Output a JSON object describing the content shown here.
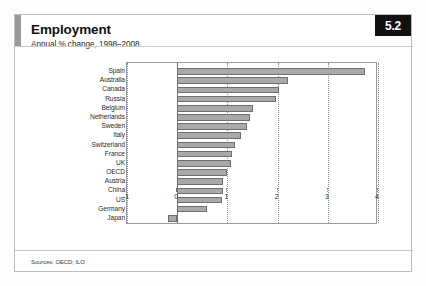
{
  "card": {
    "badge": "5.2",
    "title": "Employment",
    "subtitle": "Annual % change, 1998–2008",
    "source_note": "Sources: OECD; ILO"
  },
  "style": {
    "bar_fill": "#a9a9a9",
    "bar_stroke": "#6f6f6f",
    "badge_bg": "#111111",
    "badge_fg": "#ffffff",
    "accent": "#9a9a9a",
    "grid": "#8d8d8d",
    "frame": "#bdbdbd"
  },
  "chart_data": {
    "type": "bar",
    "orientation": "horizontal",
    "title": "Employment",
    "subtitle": "Annual % change, 1998–2008",
    "xlabel": "",
    "ylabel": "",
    "xlim": [
      -1,
      4
    ],
    "xticks": [
      -1,
      0,
      1,
      2,
      3,
      4
    ],
    "xtick_labels": [
      "-1",
      "0",
      "1",
      "2",
      "3",
      "4"
    ],
    "grid": true,
    "grid_axis": "x",
    "legend": false,
    "categories": [
      "Spain",
      "Australia",
      "Canada",
      "Russia",
      "Belgium",
      "Netherlands",
      "Sweden",
      "Italy",
      "Switzerland",
      "France",
      "UK",
      "OECD",
      "Austria",
      "China",
      "US",
      "Germany",
      "Japan"
    ],
    "values": [
      3.75,
      2.2,
      2.02,
      1.96,
      1.52,
      1.45,
      1.4,
      1.27,
      1.15,
      1.1,
      1.08,
      1.0,
      0.92,
      0.92,
      0.9,
      0.6,
      -0.18
    ],
    "source": "Sources: OECD; ILO"
  }
}
